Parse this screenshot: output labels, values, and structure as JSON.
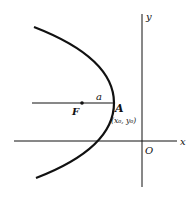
{
  "diagram": {
    "axes": {
      "x_label": "x",
      "y_label": "y",
      "origin_label": "O"
    },
    "points": {
      "focus": {
        "label": "F"
      },
      "vertex": {
        "label": "A",
        "coords_label": "(x₀, y₀)"
      }
    },
    "segment_label": "a",
    "colors": {
      "ink": "#111111",
      "background": "#ffffff"
    }
  }
}
